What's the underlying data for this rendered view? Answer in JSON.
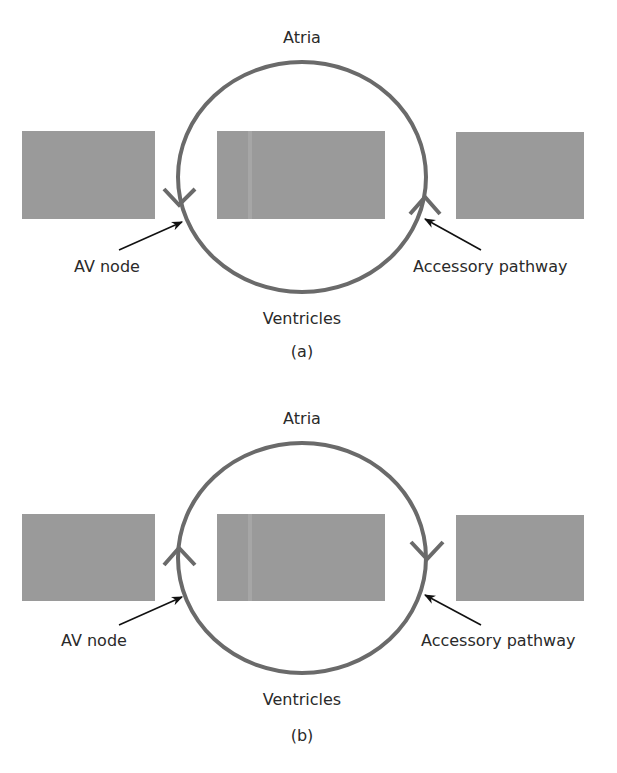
{
  "colors": {
    "background": "#ffffff",
    "block_fill": "#9a9a9a",
    "block_highlight": "#a6a6a6",
    "circuit_stroke": "#6a6a6a",
    "pointer_stroke": "#111111",
    "text": "#2a2a2a"
  },
  "panels": [
    {
      "id": "a",
      "caption": "(a)",
      "top_label": "Atria",
      "bottom_label": "Ventricles",
      "left_pointer_label": "AV node",
      "right_pointer_label": "Accessory pathway",
      "left_arrow_direction": "down",
      "right_arrow_direction": "up",
      "circulation": "counterclockwise (antegrade via AV node, retrograde via accessory pathway)"
    },
    {
      "id": "b",
      "caption": "(b)",
      "top_label": "Atria",
      "bottom_label": "Ventricles",
      "left_pointer_label": "AV node",
      "right_pointer_label": "Accessory pathway",
      "left_arrow_direction": "up",
      "right_arrow_direction": "down",
      "circulation": "clockwise (antegrade via accessory pathway, retrograde via AV node)"
    }
  ],
  "icons": {
    "block": "gray-rectangle",
    "circuit": "reentry-loop-ellipse",
    "direction_marker": "chevron-arrowhead",
    "pointer": "black-leader-arrow"
  }
}
